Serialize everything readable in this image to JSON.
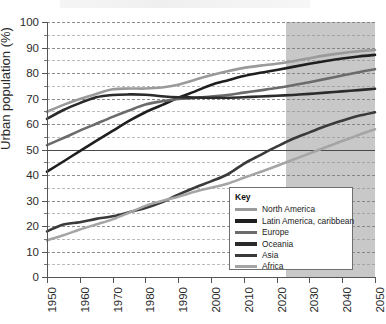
{
  "figure": {
    "title_sliver": "",
    "key_title": "Key"
  },
  "axes": {
    "ylabel": "Urban population (%)",
    "xlabel": "",
    "y_ticks": [
      0,
      10,
      20,
      30,
      40,
      50,
      60,
      70,
      80,
      90,
      100
    ],
    "y_minor_ticks": [
      5,
      15,
      25,
      35,
      45,
      55,
      65,
      75,
      85,
      95
    ],
    "x_ticks": [
      "1950",
      "1960",
      "1970",
      "1980",
      "1990",
      "2000",
      "2010",
      "2020",
      "2030",
      "2040",
      "2050"
    ]
  },
  "annotations": {
    "reference_line_value": 50,
    "projection_start_year": 2023,
    "projection_shade_color": "#b9b9b9"
  },
  "chart_data": {
    "type": "line",
    "title": "",
    "xlabel": "",
    "ylabel": "Urban population (%)",
    "xlim": [
      1950,
      2050
    ],
    "ylim": [
      0,
      100
    ],
    "grid": true,
    "legend_position": "inside-bottom-right",
    "x": [
      1950,
      1955,
      1960,
      1965,
      1970,
      1975,
      1980,
      1985,
      1990,
      1995,
      2000,
      2005,
      2010,
      2015,
      2020,
      2025,
      2030,
      2035,
      2040,
      2045,
      2050
    ],
    "series": [
      {
        "name": "North America",
        "color": "#9a9a9a",
        "values": [
          64.8,
          67.5,
          69.8,
          71.8,
          73.6,
          73.9,
          73.9,
          74.3,
          75.4,
          77.3,
          79.1,
          80.7,
          82.0,
          82.9,
          83.6,
          84.6,
          85.8,
          86.9,
          87.8,
          88.5,
          89.0
        ]
      },
      {
        "name": "Latin America, caribbean",
        "color": "#1f1f1f",
        "values": [
          41.3,
          45.3,
          49.4,
          53.4,
          57.3,
          61.2,
          64.6,
          67.4,
          70.3,
          72.7,
          75.3,
          77.1,
          78.8,
          80.1,
          81.2,
          82.4,
          83.6,
          84.7,
          85.7,
          86.5,
          87.1
        ]
      },
      {
        "name": "Europe",
        "color": "#6b6b6b",
        "values": [
          51.7,
          54.5,
          57.4,
          60.1,
          62.8,
          65.3,
          67.6,
          68.9,
          69.8,
          70.2,
          70.8,
          71.4,
          72.3,
          73.2,
          74.1,
          75.2,
          76.4,
          77.7,
          79.0,
          80.3,
          81.5
        ]
      },
      {
        "name": "Oceania",
        "color": "#2b2b2b",
        "values": [
          62.0,
          65.5,
          68.2,
          70.5,
          71.4,
          71.6,
          71.5,
          70.9,
          70.5,
          70.4,
          70.3,
          70.3,
          70.5,
          70.8,
          71.1,
          71.4,
          71.8,
          72.3,
          72.8,
          73.3,
          73.8
        ]
      },
      {
        "name": "Asia",
        "color": "#3a3a3a",
        "values": [
          17.9,
          20.6,
          21.5,
          22.8,
          23.8,
          25.4,
          27.1,
          29.3,
          32.3,
          35.0,
          37.5,
          40.2,
          44.4,
          47.8,
          51.1,
          54.2,
          56.7,
          59.2,
          61.3,
          63.2,
          64.6
        ]
      },
      {
        "name": "Africa",
        "color": "#a5a5a5",
        "values": [
          14.4,
          16.4,
          18.6,
          20.6,
          22.6,
          25.2,
          27.9,
          29.8,
          31.5,
          33.4,
          35.0,
          36.6,
          38.9,
          41.2,
          43.5,
          46.0,
          48.4,
          50.9,
          53.3,
          55.7,
          57.9
        ]
      }
    ]
  }
}
